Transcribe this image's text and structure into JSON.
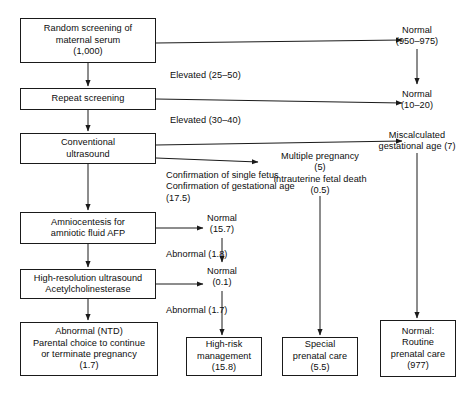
{
  "diagram": {
    "stroke_color": "#1a1a1a",
    "text_color": "#0d0d0d",
    "background": "#ffffff",
    "nodes": [
      {
        "id": "random-screening",
        "lines": [
          "Random screening of",
          "maternal serum",
          "(1,000)"
        ],
        "x": 20,
        "y": 18,
        "w": 136,
        "h": 45
      },
      {
        "id": "repeat-screening",
        "lines": [
          "Repeat screening"
        ],
        "x": 20,
        "y": 88,
        "w": 136,
        "h": 22
      },
      {
        "id": "conventional-ultrasound",
        "lines": [
          "Conventional",
          "ultrasound"
        ],
        "x": 20,
        "y": 133,
        "w": 136,
        "h": 31
      },
      {
        "id": "amniocentesis",
        "lines": [
          "Amniocentesis for",
          "amniotic fluid AFP"
        ],
        "x": 20,
        "y": 212,
        "w": 136,
        "h": 32
      },
      {
        "id": "high-resolution-ultrasound",
        "lines": [
          "High-resolution ultrasound",
          "Acetylcholinesterase"
        ],
        "x": 20,
        "y": 269,
        "w": 136,
        "h": 30
      },
      {
        "id": "abnormal-ntd",
        "lines": [
          "Abnormal (NTD)",
          "Parental choice to continue",
          "or terminate pregnancy",
          "(1.7)"
        ],
        "x": 20,
        "y": 322,
        "w": 138,
        "h": 54
      },
      {
        "id": "high-risk-management",
        "lines": [
          "High-risk",
          "management",
          "(15.8)"
        ],
        "x": 186,
        "y": 337,
        "w": 76,
        "h": 39
      },
      {
        "id": "special-prenatal-care",
        "lines": [
          "Special",
          "prenatal care",
          "(5.5)"
        ],
        "x": 282,
        "y": 337,
        "w": 76,
        "h": 39
      },
      {
        "id": "normal-routine-prenatal-care",
        "lines": [
          "Normal:",
          "Routine",
          "prenatal care",
          "(977)"
        ],
        "x": 380,
        "y": 320,
        "w": 76,
        "h": 57
      }
    ],
    "labels": [
      {
        "id": "normal-950-975",
        "lines": [
          "Normal",
          "(950–975)"
        ],
        "x": 417,
        "y": 25,
        "align": "center"
      },
      {
        "id": "elevated-25-50",
        "lines": [
          "Elevated (25–50)"
        ],
        "x": 170,
        "y": 70,
        "align": "left"
      },
      {
        "id": "normal-10-20",
        "lines": [
          "Normal",
          "(10–20)"
        ],
        "x": 417,
        "y": 89,
        "align": "center"
      },
      {
        "id": "elevated-30-40",
        "lines": [
          "Elevated (30–40)"
        ],
        "x": 170,
        "y": 115,
        "align": "left"
      },
      {
        "id": "miscalculated-gestational-age",
        "lines": [
          "Miscalculated",
          "gestational age (7)"
        ],
        "x": 417,
        "y": 130,
        "align": "center"
      },
      {
        "id": "multiple-pregnancy",
        "lines": [
          "Multiple pregnancy",
          "(5)",
          "Intrauterine fetal death",
          "(0.5)"
        ],
        "x": 320,
        "y": 151,
        "align": "center"
      },
      {
        "id": "confirmation-notes",
        "lines": [
          "Confirmation of single fetus",
          "Confirmation of gestational age",
          "(17.5)"
        ],
        "x": 166,
        "y": 170,
        "align": "left"
      },
      {
        "id": "normal-15-7",
        "lines": [
          "Normal",
          "(15.7)"
        ],
        "x": 222,
        "y": 213,
        "align": "center"
      },
      {
        "id": "abnormal-1-8",
        "lines": [
          "Abnormal (1.8)"
        ],
        "x": 166,
        "y": 249,
        "align": "left"
      },
      {
        "id": "normal-0-1",
        "lines": [
          "Normal",
          "(0.1)"
        ],
        "x": 222,
        "y": 266,
        "align": "center"
      },
      {
        "id": "abnormal-1-7",
        "lines": [
          "Abnormal (1.7)"
        ],
        "x": 166,
        "y": 305,
        "align": "left"
      }
    ],
    "connectors": [
      {
        "id": "random-to-normal-950",
        "kind": "arrow",
        "path": "M156,43 L402,40",
        "note": "Random screening right edge to Normal (950-975)"
      },
      {
        "id": "random-to-repeat",
        "kind": "arrow",
        "path": "M88,63 L88,86"
      },
      {
        "id": "repeat-to-normal-10-20",
        "kind": "arrow",
        "path": "M156,99 L402,103"
      },
      {
        "id": "normal950-to-normal1020",
        "kind": "arrow",
        "path": "M417,49 L417,84"
      },
      {
        "id": "repeat-to-conventional",
        "kind": "arrow",
        "path": "M88,110 L88,131"
      },
      {
        "id": "conventional-to-miscalculated",
        "kind": "arrow",
        "path": "M156,145 L402,141"
      },
      {
        "id": "conventional-to-multiple",
        "kind": "arrow",
        "path": "M156,158 L258,162"
      },
      {
        "id": "conventional-to-amniocentesis",
        "kind": "arrow",
        "path": "M88,164 L88,210"
      },
      {
        "id": "amnio-to-normal-15-7",
        "kind": "arrow",
        "path": "M156,228 L203,228"
      },
      {
        "id": "amnio-to-highres",
        "kind": "arrow",
        "path": "M88,244 L88,267"
      },
      {
        "id": "normal157-to-normal01",
        "kind": "arrow",
        "path": "M222,238 L222,262"
      },
      {
        "id": "highres-to-normal-0-1",
        "kind": "arrow",
        "path": "M156,284 L203,284"
      },
      {
        "id": "highres-to-abnormal-ntd",
        "kind": "arrow",
        "path": "M88,299 L88,320"
      },
      {
        "id": "normal01-to-high-risk",
        "kind": "arrow",
        "path": "M222,291 L222,335"
      },
      {
        "id": "multiple-to-special",
        "kind": "arrow",
        "path": "M320,196 L320,335"
      },
      {
        "id": "miscalculated-to-routine",
        "kind": "arrow",
        "path": "M417,153 L417,318"
      }
    ]
  }
}
